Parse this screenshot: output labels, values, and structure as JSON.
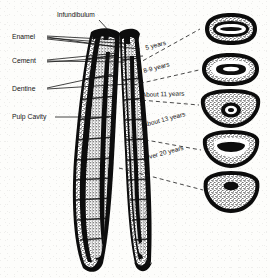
{
  "figure": {
    "type": "anatomical-illustration",
    "background_color": "#fdfdfb",
    "ink_color": "#111111"
  },
  "part_labels": [
    {
      "id": "infundibulum",
      "text": "Infundibulum",
      "x": 57,
      "y": 14
    },
    {
      "id": "enamel",
      "text": "Enamel",
      "x": 12,
      "y": 34
    },
    {
      "id": "cement",
      "text": "Cement",
      "x": 12,
      "y": 58
    },
    {
      "id": "dentine",
      "text": "Dentine",
      "x": 12,
      "y": 86
    },
    {
      "id": "pulp-cavity",
      "text": "Pulp Cavity",
      "x": 12,
      "y": 114
    }
  ],
  "age_labels": [
    {
      "id": "age-5",
      "text": "5 years",
      "x": 146,
      "y": 48,
      "rotate": -15
    },
    {
      "id": "age-8-9",
      "text": "8-9 years",
      "x": 146,
      "y": 71,
      "rotate": -15
    },
    {
      "id": "age-11",
      "text": "About 11 years",
      "x": 143,
      "y": 94,
      "rotate": -2
    },
    {
      "id": "age-13",
      "text": "About 13 years",
      "x": 145,
      "y": 124,
      "rotate": -15
    },
    {
      "id": "age-20",
      "text": "Over 20 years",
      "x": 146,
      "y": 157,
      "rotate": -15
    }
  ],
  "cross_sections": [
    {
      "id": "section-5-years",
      "age": "5 years",
      "shape": "elongated-oval",
      "cx": 230,
      "cy": 29,
      "rx": 28,
      "ry": 15
    },
    {
      "id": "section-8-9-years",
      "age": "8-9 years",
      "shape": "kidney-oval",
      "cx": 230,
      "cy": 69,
      "rx": 29,
      "ry": 16
    },
    {
      "id": "section-11-years",
      "age": "About 11 years",
      "shape": "rounded-triangular",
      "cx": 230,
      "cy": 110,
      "rx": 29,
      "ry": 18
    },
    {
      "id": "section-13-years",
      "age": "About 13 years",
      "shape": "triangular",
      "cx": 230,
      "cy": 150,
      "rx": 28,
      "ry": 18
    },
    {
      "id": "section-20-years",
      "age": "Over 20 years",
      "shape": "rounded-triangular",
      "cx": 230,
      "cy": 192,
      "rx": 27,
      "ry": 19
    }
  ]
}
